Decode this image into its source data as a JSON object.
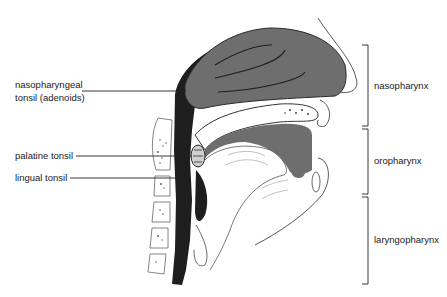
{
  "diagram": {
    "title": "",
    "left_labels": [
      {
        "id": "nasopharyngeal-tonsil",
        "line1": "nasopharyngeal",
        "line2": "tonsil (adenoids)"
      },
      {
        "id": "palatine-tonsil",
        "line1": "palatine tonsil"
      },
      {
        "id": "lingual-tonsil",
        "line1": "lingual  tonsil"
      }
    ],
    "regions": [
      {
        "id": "nasopharynx",
        "label": "nasopharynx",
        "bracket_top": 45,
        "bracket_bottom": 126
      },
      {
        "id": "oropharynx",
        "label": "oropharynx",
        "bracket_top": 129,
        "bracket_bottom": 194
      },
      {
        "id": "laryngopharynx",
        "label": "laryngopharynx",
        "bracket_top": 197,
        "bracket_bottom": 284
      }
    ],
    "colors": {
      "tissue_gray": "#6e6e6e",
      "dark": "#1c1c1c",
      "line": "#222222",
      "bg": "#ffffff"
    }
  }
}
